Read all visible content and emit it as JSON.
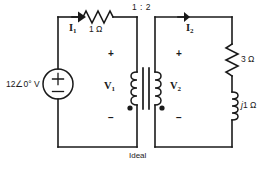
{
  "figure": {
    "caption": "Ideal",
    "line_color": "#1a1a1a",
    "background": "#ffffff"
  },
  "source": {
    "label": "12",
    "angle_symbol": "∠",
    "phase": "0°",
    "unit": "V",
    "full_label": "12∠0° V",
    "plus": "+",
    "minus": "−"
  },
  "transformer": {
    "ratio": "1 : 2",
    "type_label": "Ideal",
    "primary_dot": true,
    "secondary_dot": true
  },
  "currents": [
    {
      "name": "I",
      "subscript": "1",
      "label": "I"
    },
    {
      "name": "I",
      "subscript": "2",
      "label": "I"
    }
  ],
  "voltages": [
    {
      "name": "V",
      "subscript": "1",
      "label": "V",
      "plus": "+",
      "minus": "−"
    },
    {
      "name": "V",
      "subscript": "2",
      "label": "V",
      "plus": "+",
      "minus": "−"
    }
  ],
  "components": [
    {
      "id": "r1",
      "label": "1 Ω",
      "kind": "resistor"
    },
    {
      "id": "r3",
      "label": "3 Ω",
      "kind": "resistor"
    },
    {
      "id": "l1",
      "label_j": "j",
      "label_rest": "1 Ω",
      "label": "j1 Ω",
      "kind": "inductor"
    }
  ]
}
